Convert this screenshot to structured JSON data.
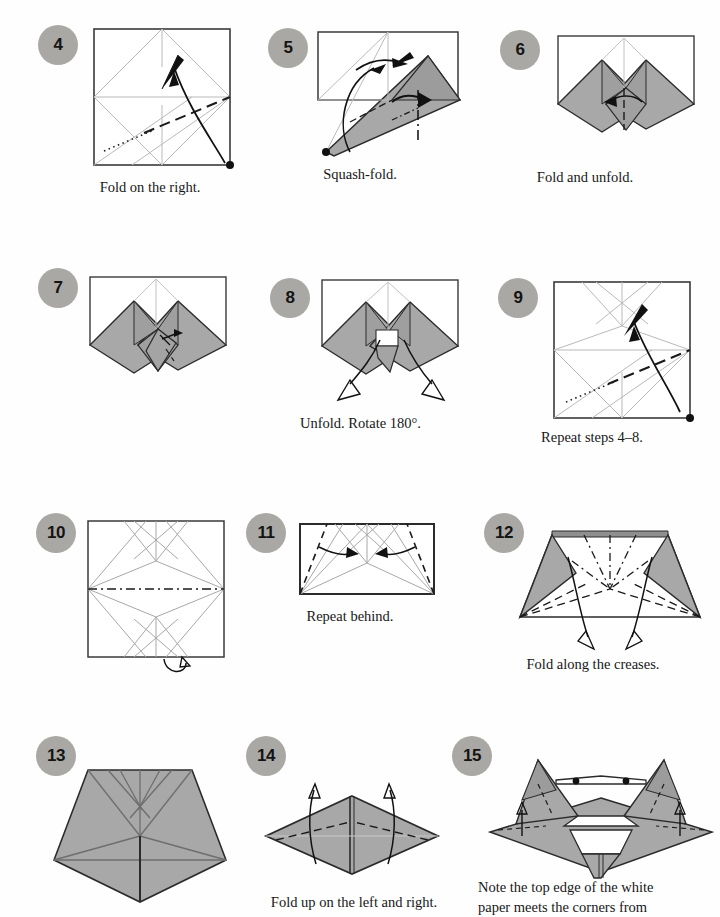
{
  "document": {
    "type": "origami-instruction-page",
    "page_width": 720,
    "page_height": 917,
    "background_color": "#fefefe",
    "badge_color": "#aaa8a5",
    "paper_shaded_color": "#a8a8a8",
    "paper_white_color": "#ffffff",
    "line_color": "#2b2b2b"
  },
  "steps": [
    {
      "number": "4",
      "caption": "Fold on the right.",
      "badge_x": 38,
      "badge_y": 25,
      "caption_x": 60,
      "caption_y": 178,
      "caption_w": 180,
      "diagram_x": 92,
      "diagram_y": 27,
      "diagram_w": 140,
      "diagram_h": 140
    },
    {
      "number": "5",
      "caption": "Squash-fold.",
      "badge_x": 268,
      "badge_y": 28,
      "caption_x": 270,
      "caption_y": 165,
      "caption_w": 180,
      "diagram_x": 308,
      "diagram_y": 30,
      "diagram_w": 152,
      "diagram_h": 125
    },
    {
      "number": "6",
      "caption": "Fold and unfold.",
      "badge_x": 500,
      "badge_y": 30,
      "caption_x": 490,
      "caption_y": 168,
      "caption_w": 190,
      "diagram_x": 556,
      "diagram_y": 34,
      "diagram_w": 134,
      "diagram_h": 102
    },
    {
      "number": "7",
      "caption": "",
      "badge_x": 38,
      "badge_y": 268,
      "caption_x": 40,
      "caption_y": 410,
      "caption_w": 190,
      "diagram_x": 88,
      "diagram_y": 275,
      "diagram_w": 136,
      "diagram_h": 102
    },
    {
      "number": "8",
      "caption": "Unfold. Rotate 180°.",
      "badge_x": 270,
      "badge_y": 278,
      "caption_x": 258,
      "caption_y": 414,
      "caption_w": 205,
      "diagram_x": 320,
      "diagram_y": 278,
      "diagram_w": 134,
      "diagram_h": 98
    },
    {
      "number": "9",
      "caption": "Repeat steps 4–8.",
      "badge_x": 498,
      "badge_y": 278,
      "caption_x": 492,
      "caption_y": 428,
      "caption_w": 200,
      "diagram_x": 552,
      "diagram_y": 280,
      "diagram_w": 136,
      "diagram_h": 136
    },
    {
      "number": "10",
      "caption": "",
      "badge_x": 36,
      "badge_y": 513,
      "caption_x": 40,
      "caption_y": 690,
      "caption_w": 190,
      "diagram_x": 86,
      "diagram_y": 519,
      "diagram_w": 138,
      "diagram_h": 136
    },
    {
      "number": "11",
      "caption": "Repeat behind.",
      "badge_x": 246,
      "badge_y": 513,
      "caption_x": 255,
      "caption_y": 607,
      "caption_w": 190,
      "diagram_x": 297,
      "diagram_y": 521,
      "diagram_w": 135,
      "diagram_h": 72
    },
    {
      "number": "12",
      "caption": "Fold along the creases.",
      "badge_x": 484,
      "badge_y": 513,
      "caption_x": 488,
      "caption_y": 655,
      "caption_w": 210,
      "diagram_x": 510,
      "diagram_y": 521,
      "diagram_w": 186,
      "diagram_h": 118
    },
    {
      "number": "13",
      "caption": "",
      "badge_x": 36,
      "badge_y": 736,
      "caption_x": 30,
      "caption_y": 912,
      "caption_w": 200,
      "diagram_x": 52,
      "diagram_y": 768,
      "diagram_w": 175,
      "diagram_h": 140
    },
    {
      "number": "14",
      "caption": "Fold up on the left and right.",
      "badge_x": 246,
      "badge_y": 736,
      "caption_x": 244,
      "caption_y": 893,
      "caption_w": 220,
      "diagram_x": 265,
      "diagram_y": 790,
      "diagram_w": 175,
      "diagram_h": 92
    },
    {
      "number": "15",
      "caption": "Note the top edge of the white\npaper meets the corners from",
      "badge_x": 452,
      "badge_y": 736,
      "caption_x": 478,
      "caption_y": 878,
      "caption_w": 230,
      "diagram_x": 490,
      "diagram_y": 756,
      "diagram_w": 222,
      "diagram_h": 120
    }
  ]
}
